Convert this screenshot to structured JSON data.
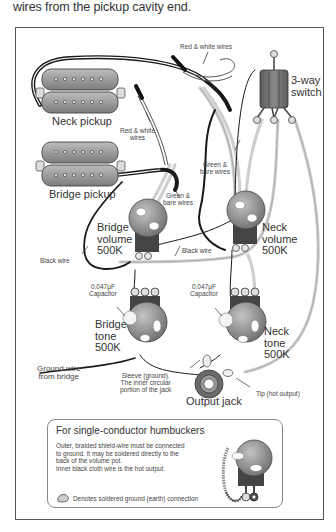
{
  "intro_text": "wires from the pickup cavity end.",
  "diagram": {
    "components": {
      "neck_pickup": "Neck pickup",
      "bridge_pickup": "Bridge pickup",
      "switch": {
        "line1": "3-way",
        "line2": "switch"
      },
      "bridge_volume": {
        "line1": "Bridge",
        "line2": "volume",
        "line3": "500K"
      },
      "neck_volume": {
        "line1": "Neck",
        "line2": "volume",
        "line3": "500K"
      },
      "bridge_tone": {
        "line1": "Bridge",
        "line2": "tone",
        "line3": "500K"
      },
      "neck_tone": {
        "line1": "Neck",
        "line2": "tone",
        "line3": "500K"
      },
      "output_jack": "Output jack"
    },
    "labels": {
      "red_white_top": "Red & white wires",
      "red_white_left": {
        "line1": "Red & white",
        "line2": "wires"
      },
      "green_bare_left": {
        "line1": "Green &",
        "line2": "bare wires"
      },
      "green_bare_right": {
        "line1": "Green &",
        "line2": "bare wires"
      },
      "black_wire_left": "Black wire",
      "black_wire_right": "Black wire",
      "cap_left": {
        "line1": "0.047μF",
        "line2": "Capacitor"
      },
      "cap_right": {
        "line1": "0.047μF",
        "line2": "Capacitor"
      },
      "ground_wire": {
        "line1": "Ground wire",
        "line2": "from bridge"
      },
      "sleeve": {
        "line1": "Sleeve (ground).",
        "line2": "The inner circular",
        "line3": "portion of the jack"
      },
      "tip": "Tip (hot output)"
    }
  },
  "note_box": {
    "title": "For single-conductor humbuckers",
    "body": [
      "Outer, braided shield-wire must be connected",
      "to ground. It may be soldered directly to the",
      "back of the volume pot.",
      "Inner black cloth wire is the hot output."
    ],
    "legend_icon": "solder-blob-icon",
    "legend_text": "Denotes soldered ground (earth) connection"
  },
  "colors": {
    "border": "#555555",
    "wire_black": "#1a1a1a",
    "wire_grey": "#c8c8c8",
    "pot_body": "#8a8a8a",
    "pickup_body": "#9a9a9a"
  }
}
